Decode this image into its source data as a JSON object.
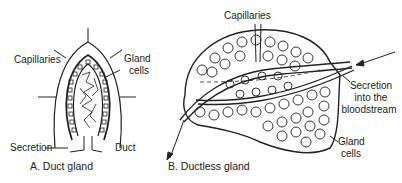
{
  "figure_a": {
    "caption": "A. Duct gland",
    "labels": {
      "capillaries": "Capillaries",
      "gland_cells_line1": "Gland",
      "gland_cells_line2": "cells",
      "secretion": "Secretion",
      "duct": "Duct"
    }
  },
  "figure_b": {
    "caption": "B. Ductless gland",
    "labels": {
      "capillaries": "Capillaries",
      "secretion_line1": "Secretion",
      "secretion_line2": "into the",
      "secretion_line3": "bloodstream",
      "gland_cells_line1": "Gland",
      "gland_cells_line2": "cells"
    }
  },
  "colors": {
    "ink": "#222222",
    "background": "#ffffff"
  }
}
